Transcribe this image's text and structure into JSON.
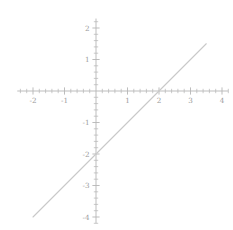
{
  "chart_data": {
    "type": "line",
    "title": "",
    "subtitle": "",
    "xlabel": "",
    "ylabel": "",
    "equation": "y = x - 2",
    "slope": 1,
    "intercept": -2,
    "x_intercept": 2,
    "y_intercept": -2,
    "grid": false,
    "legend": "none",
    "axes_style": "cartesian-crossed-at-origin",
    "xlim": [
      -2.5,
      4.2
    ],
    "ylim": [
      -4.2,
      2.3
    ],
    "xticks": [
      -2,
      -1,
      1,
      2,
      3,
      4
    ],
    "yticks": [
      2,
      1,
      -1,
      -2,
      -3,
      -4
    ],
    "xtick_labels": [
      "-2",
      "-1",
      "1",
      "2",
      "3",
      "4"
    ],
    "ytick_labels": [
      "2",
      "1",
      "-1",
      "-2",
      "-3",
      "-4"
    ],
    "minor_tick_step": 0.2,
    "series": [
      {
        "name": "y = x - 2",
        "color": "#c9c9c9",
        "x": [
          -2,
          -1,
          0,
          1,
          2,
          3,
          3.5
        ],
        "values": [
          -4,
          -3,
          -2,
          -1,
          0,
          1,
          1.5
        ],
        "x_start": -2,
        "x_end": 3.5,
        "y_start": -4,
        "y_end": 1.5
      }
    ]
  },
  "axes": {
    "axis_color": "#b5b5b5",
    "tick_color": "#b5b5b5",
    "label_color": "#9a9a9a",
    "background": "#ffffff",
    "x_axis_name": "x-axis",
    "y_axis_name": "y-axis"
  }
}
